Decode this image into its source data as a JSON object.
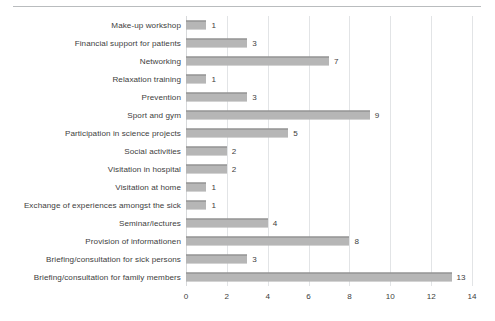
{
  "chart_data": {
    "type": "bar",
    "orientation": "horizontal",
    "title": "",
    "subtitle": "",
    "xlabel": "",
    "ylabel": "",
    "xlim": [
      0,
      14
    ],
    "xticks": [
      0,
      2,
      4,
      6,
      8,
      10,
      12,
      14
    ],
    "grid": "vertical",
    "legend": "none",
    "bar_color": "#9a9a9a",
    "bar_pattern": "50%-checkerboard-dither",
    "data_labels": true,
    "categories": [
      "Make-up workshop",
      "Financial support for patients",
      "Networking",
      "Relaxation training",
      "Prevention",
      "Sport and gym",
      "Participation in science projects",
      "Social activities",
      "Visitation in hospital",
      "Visitation at home",
      "Exchange of experiences amongst the sick",
      "Seminar/lectures",
      "Provision of informationen",
      "Briefing/consultation for sick persons",
      "Briefing/consultation for family members"
    ],
    "values": [
      1,
      3,
      7,
      1,
      3,
      9,
      5,
      2,
      2,
      1,
      1,
      4,
      8,
      3,
      13
    ],
    "value_labels": [
      "1",
      "3",
      "7",
      "1",
      "3",
      "9",
      "5",
      "2",
      "2",
      "1",
      "1",
      "4",
      "8",
      "3",
      "13"
    ],
    "xtick_labels": [
      "0",
      "2",
      "4",
      "6",
      "8",
      "10",
      "12",
      "14"
    ]
  }
}
